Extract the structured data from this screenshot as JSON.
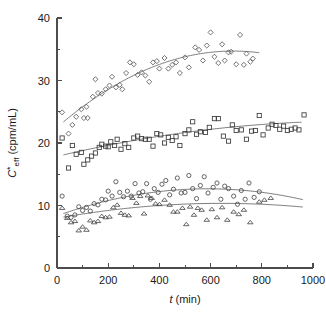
{
  "chart_data": {
    "type": "scatter",
    "title": "",
    "subtitle": "",
    "xlabel": "t (min)",
    "xlabel_italic_part": "t",
    "xlabel_rest": " (min)",
    "ylabel": "C*eff (cpm/mL)",
    "ylabel_italic_part": "C",
    "ylabel_superscript": "*",
    "ylabel_subscript": "eff",
    "ylabel_rest": " (cpm/mL)",
    "xlim": [
      0,
      1000
    ],
    "ylim": [
      0,
      40
    ],
    "xticks": [
      0,
      200,
      400,
      600,
      800,
      1000
    ],
    "xticklabels": [
      "0",
      "200",
      "400",
      "600",
      "800",
      "1000"
    ],
    "xminorticks": [
      100,
      300,
      500,
      700,
      900
    ],
    "yticks": [
      0,
      10,
      20,
      30,
      40
    ],
    "yticklabels": [
      "0",
      "10",
      "20",
      "30",
      "40"
    ],
    "yminorticks": [
      5,
      15,
      25,
      35
    ],
    "grid": false,
    "legend": "none",
    "series": [
      {
        "name": "diamond-series",
        "marker": "diamond",
        "marker_size": 4.4,
        "points": [
          [
            20,
            24.9
          ],
          [
            45,
            21.5
          ],
          [
            60,
            22.9
          ],
          [
            75,
            24.2
          ],
          [
            95,
            25.4
          ],
          [
            105,
            24.0
          ],
          [
            115,
            25.8
          ],
          [
            120,
            24.0
          ],
          [
            140,
            27.4
          ],
          [
            150,
            30.2
          ],
          [
            160,
            28.0
          ],
          [
            175,
            27.9
          ],
          [
            190,
            28.6
          ],
          [
            205,
            29.2
          ],
          [
            215,
            30.6
          ],
          [
            230,
            28.9
          ],
          [
            245,
            29.3
          ],
          [
            255,
            28.6
          ],
          [
            270,
            31.2
          ],
          [
            285,
            32.9
          ],
          [
            300,
            32.6
          ],
          [
            315,
            30.9
          ],
          [
            330,
            31.3
          ],
          [
            345,
            30.8
          ],
          [
            360,
            29.8
          ],
          [
            375,
            32.9
          ],
          [
            390,
            33.1
          ],
          [
            400,
            31.9
          ],
          [
            420,
            33.6
          ],
          [
            435,
            31.9
          ],
          [
            450,
            32.5
          ],
          [
            465,
            32.9
          ],
          [
            480,
            31.2
          ],
          [
            500,
            33.7
          ],
          [
            515,
            32.1
          ],
          [
            540,
            35.3
          ],
          [
            555,
            34.9
          ],
          [
            570,
            33.2
          ],
          [
            585,
            35.6
          ],
          [
            600,
            37.7
          ],
          [
            615,
            33.8
          ],
          [
            630,
            32.8
          ],
          [
            645,
            35.8
          ],
          [
            655,
            33.2
          ],
          [
            670,
            34.5
          ],
          [
            680,
            34.6
          ],
          [
            700,
            32.6
          ],
          [
            715,
            37.3
          ],
          [
            730,
            32.5
          ],
          [
            740,
            34.3
          ],
          [
            755,
            33.0
          ],
          [
            765,
            33.5
          ]
        ],
        "fit": {
          "type": "quadratic",
          "coefficients": [
            22.5,
            0.0355,
            -2.58e-05
          ],
          "x_start": 25,
          "x_end": 790
        }
      },
      {
        "name": "square-series",
        "marker": "square",
        "marker_size": 4.2,
        "points": [
          [
            20,
            20.8
          ],
          [
            45,
            16.0
          ],
          [
            60,
            19.6
          ],
          [
            75,
            18.2
          ],
          [
            95,
            18.5
          ],
          [
            105,
            16.6
          ],
          [
            120,
            17.3
          ],
          [
            135,
            17.9
          ],
          [
            150,
            18.4
          ],
          [
            165,
            19.3
          ],
          [
            175,
            19.8
          ],
          [
            190,
            19.5
          ],
          [
            200,
            19.4
          ],
          [
            210,
            20.2
          ],
          [
            225,
            19.6
          ],
          [
            235,
            20.6
          ],
          [
            250,
            19.0
          ],
          [
            265,
            19.9
          ],
          [
            280,
            19.3
          ],
          [
            300,
            20.8
          ],
          [
            315,
            21.1
          ],
          [
            330,
            20.7
          ],
          [
            345,
            20.6
          ],
          [
            360,
            20.6
          ],
          [
            375,
            19.5
          ],
          [
            390,
            21.5
          ],
          [
            405,
            21.3
          ],
          [
            420,
            20.0
          ],
          [
            435,
            20.9
          ],
          [
            450,
            20.4
          ],
          [
            465,
            21.0
          ],
          [
            480,
            19.6
          ],
          [
            500,
            21.5
          ],
          [
            515,
            22.1
          ],
          [
            530,
            23.4
          ],
          [
            545,
            21.4
          ],
          [
            560,
            21.8
          ],
          [
            580,
            21.7
          ],
          [
            595,
            22.5
          ],
          [
            615,
            23.9
          ],
          [
            630,
            23.9
          ],
          [
            650,
            21.1
          ],
          [
            670,
            20.3
          ],
          [
            685,
            22.9
          ],
          [
            700,
            22.0
          ],
          [
            720,
            22.1
          ],
          [
            740,
            20.6
          ],
          [
            760,
            21.9
          ],
          [
            775,
            22.0
          ],
          [
            790,
            24.4
          ],
          [
            805,
            21.3
          ],
          [
            825,
            22.4
          ],
          [
            840,
            23.0
          ],
          [
            855,
            22.8
          ],
          [
            870,
            22.2
          ],
          [
            885,
            22.7
          ],
          [
            900,
            22.0
          ],
          [
            915,
            22.2
          ],
          [
            930,
            22.4
          ],
          [
            945,
            22.1
          ],
          [
            965,
            24.5
          ]
        ],
        "fit": {
          "type": "quadratic",
          "coefficients": [
            17.85,
            0.00975,
            -4.2e-06
          ],
          "x_start": 25,
          "x_end": 955
        }
      },
      {
        "name": "circle-series",
        "marker": "circle",
        "marker_size": 4.2,
        "points": [
          [
            20,
            11.5
          ],
          [
            40,
            8.3
          ],
          [
            55,
            8.1
          ],
          [
            70,
            8.5
          ],
          [
            85,
            9.8
          ],
          [
            100,
            9.2
          ],
          [
            115,
            9.7
          ],
          [
            130,
            9.1
          ],
          [
            145,
            10.3
          ],
          [
            160,
            10.1
          ],
          [
            175,
            11.0
          ],
          [
            190,
            10.9
          ],
          [
            200,
            12.3
          ],
          [
            215,
            11.5
          ],
          [
            230,
            13.8
          ],
          [
            245,
            12.1
          ],
          [
            260,
            11.4
          ],
          [
            275,
            12.3
          ],
          [
            290,
            11.5
          ],
          [
            305,
            13.5
          ],
          [
            320,
            12.0
          ],
          [
            335,
            12.2
          ],
          [
            350,
            13.5
          ],
          [
            365,
            11.0
          ],
          [
            380,
            12.7
          ],
          [
            395,
            12.1
          ],
          [
            410,
            13.4
          ],
          [
            425,
            14.0
          ],
          [
            440,
            11.7
          ],
          [
            455,
            12.6
          ],
          [
            470,
            14.4
          ],
          [
            485,
            12.0
          ],
          [
            500,
            12.1
          ],
          [
            515,
            14.8
          ],
          [
            530,
            12.7
          ],
          [
            545,
            11.1
          ],
          [
            560,
            13.2
          ],
          [
            575,
            14.6
          ],
          [
            590,
            12.0
          ],
          [
            610,
            12.9
          ],
          [
            625,
            13.6
          ],
          [
            640,
            11.0
          ],
          [
            655,
            13.1
          ],
          [
            670,
            12.7
          ],
          [
            690,
            11.5
          ],
          [
            705,
            10.2
          ],
          [
            720,
            12.4
          ],
          [
            735,
            11.0
          ],
          [
            750,
            13.6
          ],
          [
            770,
            11.3
          ],
          [
            790,
            12.2
          ]
        ],
        "fit": {
          "type": "quadratic",
          "coefficients": [
            8.35,
            0.0147,
            -1.25e-05
          ],
          "x_start": 25,
          "x_end": 960
        }
      },
      {
        "name": "triangle-series",
        "marker": "triangle",
        "marker_size": 4.6,
        "points": [
          [
            20,
            9.6
          ],
          [
            40,
            8.0
          ],
          [
            55,
            7.3
          ],
          [
            70,
            7.5
          ],
          [
            85,
            6.0
          ],
          [
            100,
            6.6
          ],
          [
            115,
            6.1
          ],
          [
            130,
            7.6
          ],
          [
            145,
            7.3
          ],
          [
            160,
            7.5
          ],
          [
            175,
            8.3
          ],
          [
            190,
            8.1
          ],
          [
            205,
            8.2
          ],
          [
            220,
            9.7
          ],
          [
            235,
            10.1
          ],
          [
            250,
            8.8
          ],
          [
            265,
            8.5
          ],
          [
            280,
            8.4
          ],
          [
            295,
            11.2
          ],
          [
            310,
            10.4
          ],
          [
            325,
            11.5
          ],
          [
            340,
            8.7
          ],
          [
            355,
            11.6
          ],
          [
            370,
            11.2
          ],
          [
            385,
            10.3
          ],
          [
            400,
            10.2
          ],
          [
            420,
            10.9
          ],
          [
            440,
            10.1
          ],
          [
            455,
            9.0
          ],
          [
            470,
            9.0
          ],
          [
            490,
            9.6
          ],
          [
            505,
            7.0
          ],
          [
            520,
            9.8
          ],
          [
            535,
            8.5
          ],
          [
            550,
            9.6
          ],
          [
            565,
            9.3
          ],
          [
            585,
            7.7
          ],
          [
            605,
            9.4
          ],
          [
            625,
            8.1
          ],
          [
            645,
            9.7
          ],
          [
            665,
            7.7
          ],
          [
            690,
            9.0
          ],
          [
            710,
            8.6
          ],
          [
            730,
            9.3
          ],
          [
            755,
            7.3
          ],
          [
            790,
            10.6
          ],
          [
            810,
            10.9
          ],
          [
            835,
            11.2
          ]
        ],
        "fit": {
          "type": "quadratic",
          "coefficients": [
            7.95,
            0.00745,
            -5.8e-06
          ],
          "x_start": 25,
          "x_end": 960
        }
      }
    ]
  },
  "geometry": {
    "plot_left": 57,
    "plot_right": 313,
    "plot_bottom": 268,
    "plot_top": 18
  }
}
